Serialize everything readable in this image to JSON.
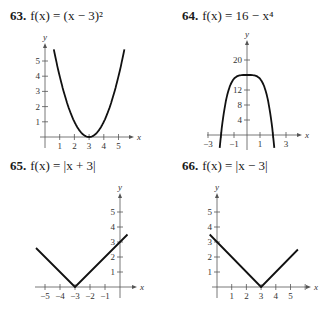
{
  "problems": [
    {
      "number": "63.",
      "function": "f(x) = (x − 3)²"
    },
    {
      "number": "64.",
      "function": "f(x) = 16 − x⁴"
    },
    {
      "number": "65.",
      "function": "f(x) = |x + 3|"
    },
    {
      "number": "66.",
      "function": "f(x) = |x − 3|"
    }
  ],
  "chart_data": [
    {
      "type": "line",
      "title": "63. f(x) = (x − 3)²",
      "xlabel": "x",
      "ylabel": "y",
      "xticks": [
        1,
        2,
        3,
        4,
        5
      ],
      "yticks": [
        1,
        2,
        3,
        4,
        5
      ],
      "xlim": [
        -0.5,
        6
      ],
      "ylim": [
        -0.5,
        6
      ],
      "x": [
        0.6,
        1,
        1.5,
        2,
        2.5,
        3,
        3.5,
        4,
        4.5,
        5,
        5.4
      ],
      "y": [
        5.76,
        4,
        2.25,
        1,
        0.25,
        0,
        0.25,
        1,
        2.25,
        4,
        5.76
      ],
      "grid": false
    },
    {
      "type": "line",
      "title": "64. f(x) = 16 − x⁴",
      "xlabel": "x",
      "ylabel": "y",
      "xticks": [
        -3,
        -1,
        1,
        3
      ],
      "yticks": [
        4,
        8,
        12,
        20
      ],
      "xlim": [
        -3.5,
        3.5
      ],
      "ylim": [
        -2,
        24
      ],
      "x": [
        -2.1,
        -2,
        -1.5,
        -1,
        -0.5,
        0,
        0.5,
        1,
        1.5,
        2,
        2.1
      ],
      "y": [
        -3.45,
        0,
        10.94,
        15,
        15.94,
        16,
        15.94,
        15,
        10.94,
        0,
        -3.45
      ],
      "grid": false
    },
    {
      "type": "line",
      "title": "65. f(x) = |x + 3|",
      "xlabel": "x",
      "ylabel": "y",
      "xticks": [
        -5,
        -4,
        -3,
        -2,
        -1
      ],
      "yticks": [
        1,
        2,
        3,
        4,
        5
      ],
      "xlim": [
        -6,
        1
      ],
      "ylim": [
        -0.5,
        6
      ],
      "x": [
        -5.6,
        -3,
        0.5
      ],
      "y": [
        2.6,
        0,
        3.5
      ],
      "grid": false
    },
    {
      "type": "line",
      "title": "66. f(x) = |x − 3|",
      "xlabel": "x",
      "ylabel": "y",
      "xticks": [
        1,
        2,
        3,
        4,
        5
      ],
      "yticks": [
        1,
        2,
        3,
        4,
        5
      ],
      "xlim": [
        -1,
        6
      ],
      "ylim": [
        -0.5,
        6
      ],
      "x": [
        -0.5,
        3,
        5.5
      ],
      "y": [
        3.5,
        0,
        2.5
      ],
      "grid": false
    }
  ]
}
